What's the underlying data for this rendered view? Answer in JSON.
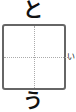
{
  "practice_cell": {
    "above_char": "と",
    "below_char": "う",
    "side_char": "い",
    "box_border_color": "#666666",
    "guide_color": "#aaaaaa"
  }
}
